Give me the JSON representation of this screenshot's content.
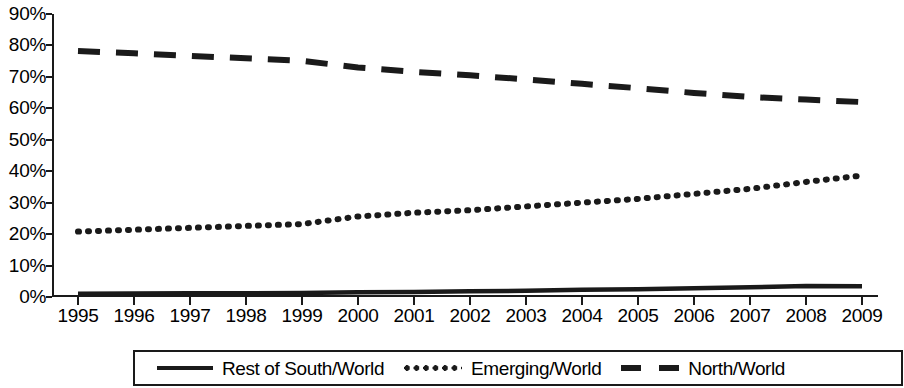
{
  "chart_data": {
    "type": "line",
    "title": "",
    "subtitle": "",
    "xlabel": "",
    "ylabel": "",
    "grid": false,
    "legend_position": "bottom",
    "ylim": [
      0,
      90
    ],
    "ytick_step": 10,
    "ytick_labels": [
      "90%",
      "80%",
      "70%",
      "60%",
      "50%",
      "40%",
      "30%",
      "20%",
      "10%",
      "0%"
    ],
    "ytick_values": [
      90,
      80,
      70,
      60,
      50,
      40,
      30,
      20,
      10,
      0
    ],
    "categories": [
      "1995",
      "1996",
      "1997",
      "1998",
      "1999",
      "2000",
      "2001",
      "2002",
      "2003",
      "2004",
      "2005",
      "2006",
      "2007",
      "2008",
      "2009"
    ],
    "x": [
      1995,
      1996,
      1997,
      1998,
      1999,
      2000,
      2001,
      2002,
      2003,
      2004,
      2005,
      2006,
      2007,
      2008,
      2009
    ],
    "series": [
      {
        "name": "Rest of South/World",
        "style": "solid",
        "color": "#1a1a1a",
        "values": [
          1.0,
          1.1,
          1.2,
          1.2,
          1.3,
          1.5,
          1.6,
          1.8,
          2.0,
          2.3,
          2.5,
          2.8,
          3.1,
          3.5,
          3.4
        ]
      },
      {
        "name": "Emerging/World",
        "style": "dotted",
        "color": "#1a1a1a",
        "values": [
          20.8,
          21.4,
          22.0,
          22.6,
          23.2,
          25.6,
          26.8,
          27.6,
          28.8,
          30.0,
          31.2,
          32.8,
          34.4,
          36.6,
          38.6
        ]
      },
      {
        "name": "North/World",
        "style": "dashed",
        "color": "#1a1a1a",
        "values": [
          78.2,
          77.5,
          76.7,
          75.9,
          75.1,
          73.0,
          71.6,
          70.5,
          69.2,
          67.8,
          66.4,
          64.9,
          63.6,
          62.8,
          62.0
        ]
      }
    ]
  },
  "legend": {
    "items": [
      {
        "label": "Rest of South/World",
        "swatch": "solid-line-swatch"
      },
      {
        "label": "Emerging/World",
        "swatch": "dotted-line-swatch"
      },
      {
        "label": "North/World",
        "swatch": "dashed-line-swatch"
      }
    ]
  },
  "colors": {
    "series": "#1a1a1a",
    "axis": "#1a1a1a",
    "background": "#ffffff"
  }
}
